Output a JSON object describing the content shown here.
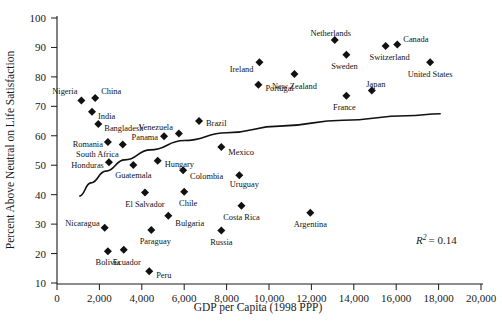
{
  "chart_data": {
    "type": "scatter",
    "title": "",
    "xlabel": "GDP per Capita (1998 PPP)",
    "ylabel": "Percent Above Neutral on Life Satisfaction",
    "xlim": [
      0,
      20000
    ],
    "ylim": [
      10,
      100
    ],
    "xticks": [
      "0",
      "2,000",
      "4,000",
      "6,000",
      "8,000",
      "10,000",
      "12,000",
      "14,000",
      "16,000",
      "18,000",
      "20,000"
    ],
    "xtick_values": [
      0,
      2000,
      4000,
      6000,
      8000,
      10000,
      12000,
      14000,
      16000,
      18000,
      20000
    ],
    "yticks": [
      "10",
      "20",
      "30",
      "40",
      "50",
      "60",
      "70",
      "80",
      "90",
      "100"
    ],
    "ytick_values": [
      10,
      20,
      30,
      40,
      50,
      60,
      70,
      80,
      90,
      100
    ],
    "grid": false,
    "legend": null,
    "annotations": [
      {
        "text": "R2 = 0.14",
        "r_symbol": "R",
        "exponent": "2",
        "equals_value": "= 0.14",
        "x": 17000,
        "y": 26
      }
    ],
    "fit_curve": {
      "kind": "logarithmic-trendline",
      "points": [
        {
          "x": 1050,
          "y": 39.5
        },
        {
          "x": 1600,
          "y": 44.0
        },
        {
          "x": 2300,
          "y": 48.0
        },
        {
          "x": 3200,
          "y": 51.8
        },
        {
          "x": 4400,
          "y": 55.2
        },
        {
          "x": 6000,
          "y": 58.4
        },
        {
          "x": 8000,
          "y": 61.0
        },
        {
          "x": 10500,
          "y": 63.3
        },
        {
          "x": 13500,
          "y": 65.3
        },
        {
          "x": 16500,
          "y": 66.8
        },
        {
          "x": 18100,
          "y": 67.5
        }
      ]
    },
    "points": [
      {
        "label": "Nigeria",
        "x": 1150,
        "y": 72.0,
        "lx": -4,
        "ly": -9,
        "anchor": "end"
      },
      {
        "label": "China",
        "x": 1800,
        "y": 72.8,
        "lx": 6,
        "ly": -7,
        "anchor": "start"
      },
      {
        "label": "India",
        "x": 1650,
        "y": 68.2,
        "lx": 6,
        "ly": 4,
        "anchor": "start"
      },
      {
        "label": "Bangladesh",
        "x": 1950,
        "y": 64.0,
        "lx": 6,
        "ly": 4,
        "anchor": "start"
      },
      {
        "label": "Romania",
        "x": 2400,
        "y": 57.9,
        "lx": -5,
        "ly": 2,
        "anchor": "end"
      },
      {
        "label": "South Africa",
        "x": 3100,
        "y": 57.0,
        "lx": -4,
        "ly": 9,
        "anchor": "end"
      },
      {
        "label": "Honduras",
        "x": 2450,
        "y": 51.0,
        "lx": -5,
        "ly": 3,
        "anchor": "end"
      },
      {
        "label": "Guatemala",
        "x": 3600,
        "y": 50.1,
        "lx": 0,
        "ly": 10,
        "anchor": "middle"
      },
      {
        "label": "Panama",
        "x": 5050,
        "y": 59.8,
        "lx": -6,
        "ly": 1,
        "anchor": "end"
      },
      {
        "label": "Venezuela",
        "x": 5750,
        "y": 60.8,
        "lx": -6,
        "ly": -6,
        "anchor": "end"
      },
      {
        "label": "Brazil",
        "x": 6700,
        "y": 65.0,
        "lx": 7,
        "ly": 2,
        "anchor": "start"
      },
      {
        "label": "Hungary",
        "x": 4750,
        "y": 51.5,
        "lx": 7,
        "ly": 3,
        "anchor": "start"
      },
      {
        "label": "Colombia",
        "x": 5950,
        "y": 48.3,
        "lx": 7,
        "ly": 6,
        "anchor": "start"
      },
      {
        "label": "Mexico",
        "x": 7750,
        "y": 56.2,
        "lx": 7,
        "ly": 5,
        "anchor": "start"
      },
      {
        "label": "Uruguay",
        "x": 8600,
        "y": 46.6,
        "lx": 5,
        "ly": 9,
        "anchor": "middle"
      },
      {
        "label": "El Salvador",
        "x": 4150,
        "y": 40.7,
        "lx": 0,
        "ly": 11,
        "anchor": "middle"
      },
      {
        "label": "Chile",
        "x": 6000,
        "y": 41.0,
        "lx": 4,
        "ly": 11,
        "anchor": "middle"
      },
      {
        "label": "Costa Rica",
        "x": 8700,
        "y": 36.2,
        "lx": 0,
        "ly": 11,
        "anchor": "middle"
      },
      {
        "label": "Bulgaria",
        "x": 5250,
        "y": 32.8,
        "lx": 7,
        "ly": 7,
        "anchor": "start"
      },
      {
        "label": "Nicaragua",
        "x": 2250,
        "y": 28.8,
        "lx": -5,
        "ly": -5,
        "anchor": "end"
      },
      {
        "label": "Paraguay",
        "x": 4450,
        "y": 28.0,
        "lx": 4,
        "ly": 11,
        "anchor": "middle"
      },
      {
        "label": "Russia",
        "x": 7750,
        "y": 27.8,
        "lx": 0,
        "ly": 11,
        "anchor": "middle"
      },
      {
        "label": "Argentina",
        "x": 11950,
        "y": 33.9,
        "lx": 0,
        "ly": 11,
        "anchor": "middle"
      },
      {
        "label": "Bolivia",
        "x": 2400,
        "y": 20.8,
        "lx": 0,
        "ly": 11,
        "anchor": "middle"
      },
      {
        "label": "Ecuador",
        "x": 3150,
        "y": 21.3,
        "lx": 3,
        "ly": 12,
        "anchor": "middle"
      },
      {
        "label": "Peru",
        "x": 4350,
        "y": 14.0,
        "lx": 7,
        "ly": 4,
        "anchor": "start"
      },
      {
        "label": "Portugal",
        "x": 9500,
        "y": 77.3,
        "lx": 7,
        "ly": 3,
        "anchor": "start"
      },
      {
        "label": "Ireland",
        "x": 9550,
        "y": 85.0,
        "lx": -6,
        "ly": 7,
        "anchor": "end"
      },
      {
        "label": "New Zealand",
        "x": 11200,
        "y": 81.0,
        "lx": 0,
        "ly": 12,
        "anchor": "middle"
      },
      {
        "label": "Netherlands",
        "x": 13100,
        "y": 92.5,
        "lx": -4,
        "ly": -7,
        "anchor": "middle"
      },
      {
        "label": "Sweden",
        "x": 13650,
        "y": 87.5,
        "lx": -2,
        "ly": 11,
        "anchor": "middle"
      },
      {
        "label": "Switzerland",
        "x": 15500,
        "y": 90.5,
        "lx": 4,
        "ly": 11,
        "anchor": "middle"
      },
      {
        "label": "Canada",
        "x": 16050,
        "y": 91.0,
        "lx": 6,
        "ly": -6,
        "anchor": "start"
      },
      {
        "label": "United States",
        "x": 17600,
        "y": 85.0,
        "lx": 0,
        "ly": 12,
        "anchor": "middle"
      },
      {
        "label": "France",
        "x": 13650,
        "y": 73.6,
        "lx": -2,
        "ly": 11,
        "anchor": "middle"
      },
      {
        "label": "Japan",
        "x": 14850,
        "y": 75.4,
        "lx": 4,
        "ly": -6,
        "anchor": "middle"
      }
    ]
  }
}
